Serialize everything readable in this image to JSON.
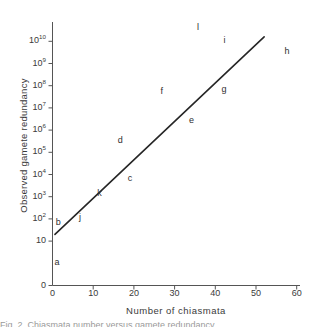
{
  "chart_data": {
    "type": "scatter",
    "title": "",
    "xlabel": "Number of chiasmata",
    "ylabel": "Observed gamete redundancy",
    "xlim": [
      0,
      60
    ],
    "xticks": [
      "0",
      "10",
      "20",
      "30",
      "40",
      "50",
      "60"
    ],
    "xtick_values": [
      0,
      10,
      20,
      30,
      40,
      50,
      60
    ],
    "yticks": [
      "0",
      "10",
      "10²",
      "10³",
      "10⁴",
      "10⁵",
      "10⁶",
      "10⁷",
      "10⁸",
      "10⁹",
      "10¹⁰"
    ],
    "ytick_mantissa": [
      "0",
      "10",
      "10",
      "10",
      "10",
      "10",
      "10",
      "10",
      "10",
      "10",
      "10"
    ],
    "ytick_exponent": [
      "",
      "",
      "2",
      "3",
      "4",
      "5",
      "6",
      "7",
      "8",
      "9",
      "10"
    ],
    "ytick_decades": [
      -1,
      1,
      2,
      3,
      4,
      5,
      6,
      7,
      8,
      9,
      10
    ],
    "yscale": "log",
    "grid": false,
    "legend": "none",
    "series": [
      {
        "name": "fitted line",
        "type": "line",
        "color": "#262626",
        "x": [
          0.6,
          52.0
        ],
        "y_decade": [
          1.3,
          10.2
        ]
      },
      {
        "name": "labelled points",
        "type": "text-labels",
        "points": [
          {
            "label": "a",
            "x": 1.0,
            "y_decade": 0.0
          },
          {
            "label": "b",
            "x": 1.3,
            "y_decade": 1.8
          },
          {
            "label": "j",
            "x": 7.0,
            "y_decade": 2.05
          },
          {
            "label": "k",
            "x": 11.5,
            "y_decade": 3.1
          },
          {
            "label": "c",
            "x": 19.0,
            "y_decade": 3.8
          },
          {
            "label": "d",
            "x": 16.5,
            "y_decade": 5.5
          },
          {
            "label": "e",
            "x": 34.0,
            "y_decade": 6.4
          },
          {
            "label": "f",
            "x": 27.0,
            "y_decade": 7.7
          },
          {
            "label": "g",
            "x": 42.0,
            "y_decade": 7.8
          },
          {
            "label": "i",
            "x": 42.5,
            "y_decade": 10.0
          },
          {
            "label": "l",
            "x": 36.0,
            "y_decade": 10.6
          },
          {
            "label": "h",
            "x": 57.5,
            "y_decade": 9.5
          }
        ]
      }
    ]
  },
  "figure": {
    "caption_sliver": "Fig. 2. Chiasmata number versus gamete redundancy"
  }
}
